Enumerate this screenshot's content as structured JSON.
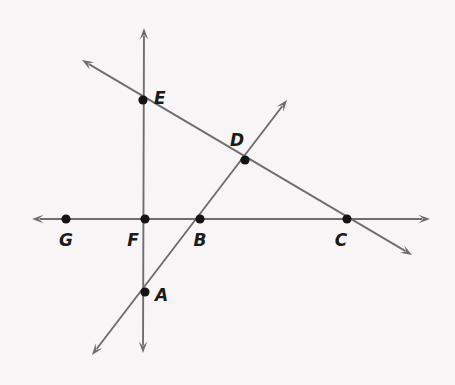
{
  "figure": {
    "background_color": "#f7f5f6",
    "line_color": "#6e6e72",
    "point_color": "#141414",
    "label_color": "#1b1b1b",
    "width": 455,
    "height": 385
  },
  "chart_data": {
    "type": "diagram",
    "subtype": "euclidean-line-figure",
    "title": "",
    "xlabel": "",
    "ylabel": "",
    "grid": false,
    "legend": null,
    "xlim": [
      0,
      455
    ],
    "ylim": [
      385,
      0
    ],
    "coordinate_note": "pixel coordinates, origin at top-left of image",
    "points": [
      {
        "label": "A",
        "x": 145,
        "y": 292,
        "label_x": 155,
        "label_y": 301,
        "label_anchor": "start"
      },
      {
        "label": "B",
        "x": 200,
        "y": 219,
        "label_x": 200,
        "label_y": 246,
        "label_anchor": "middle"
      },
      {
        "label": "C",
        "x": 347,
        "y": 219,
        "label_x": 341,
        "label_y": 246,
        "label_anchor": "middle"
      },
      {
        "label": "D",
        "x": 245,
        "y": 160,
        "label_x": 237,
        "label_y": 146,
        "label_anchor": "middle"
      },
      {
        "label": "E",
        "x": 143,
        "y": 100,
        "label_x": 154,
        "label_y": 104,
        "label_anchor": "start"
      },
      {
        "label": "F",
        "x": 145,
        "y": 219,
        "label_x": 133,
        "label_y": 246,
        "label_anchor": "middle"
      },
      {
        "label": "G",
        "x": 66,
        "y": 219,
        "label_x": 66,
        "label_y": 246,
        "label_anchor": "middle"
      }
    ],
    "lines": [
      {
        "name": "horizontal-line-GFBC",
        "through_points": [
          "G",
          "F",
          "B",
          "C"
        ],
        "x1": 32,
        "y1": 219,
        "x2": 430,
        "y2": 219,
        "arrow_start": true,
        "arrow_end": true,
        "orientation": "horizontal"
      },
      {
        "name": "vertical-line-EFA",
        "through_points": [
          "E",
          "F",
          "A"
        ],
        "x1": 144,
        "y1": 28,
        "x2": 143,
        "y2": 353,
        "arrow_start": true,
        "arrow_end": true,
        "orientation": "vertical"
      },
      {
        "name": "descending-line-EDC",
        "through_points": [
          "E",
          "D",
          "C"
        ],
        "x1": 82,
        "y1": 60,
        "x2": 412,
        "y2": 255,
        "arrow_start": true,
        "arrow_end": true,
        "orientation": "descending-diagonal"
      },
      {
        "name": "ascending-line-ABD",
        "through_points": [
          "A",
          "B",
          "D"
        ],
        "x1": 92,
        "y1": 355,
        "x2": 287,
        "y2": 100,
        "arrow_start": true,
        "arrow_end": true,
        "orientation": "ascending-diagonal"
      }
    ]
  }
}
